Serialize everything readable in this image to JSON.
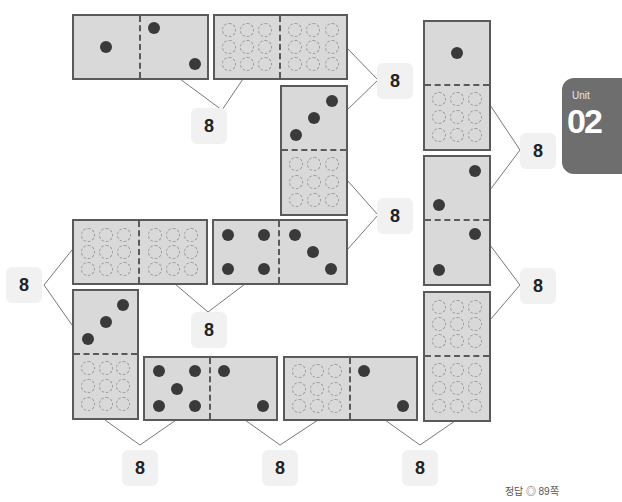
{
  "badge": {
    "unit_label": "Unit",
    "unit_number": "02",
    "color": "#6e6e6e"
  },
  "answer_ref": "정답 ◎ 89쪽",
  "labels": [
    {
      "id": "top-mid",
      "value": "8"
    },
    {
      "id": "top-right",
      "value": "8"
    },
    {
      "id": "mid-right-a",
      "value": "8"
    },
    {
      "id": "far-right-a",
      "value": "8"
    },
    {
      "id": "far-right-b",
      "value": "8"
    },
    {
      "id": "left",
      "value": "8"
    },
    {
      "id": "mid",
      "value": "8"
    },
    {
      "id": "bottom-1",
      "value": "8"
    },
    {
      "id": "bottom-2",
      "value": "8"
    },
    {
      "id": "bottom-3",
      "value": "8"
    }
  ],
  "dominoes": [
    {
      "id": "d1",
      "orientation": "horizontal",
      "a": "1",
      "b": "2"
    },
    {
      "id": "d2",
      "orientation": "horizontal",
      "a": "?",
      "b": "?"
    },
    {
      "id": "d3",
      "orientation": "vertical",
      "a": "3",
      "b": "?"
    },
    {
      "id": "d4",
      "orientation": "vertical",
      "a": "1",
      "b": "?"
    },
    {
      "id": "d5",
      "orientation": "vertical",
      "a": "2",
      "b": "2"
    },
    {
      "id": "d6",
      "orientation": "vertical",
      "a": "?",
      "b": "?"
    },
    {
      "id": "d7",
      "orientation": "horizontal",
      "a": "?",
      "b": "?"
    },
    {
      "id": "d8",
      "orientation": "horizontal",
      "a": "4",
      "b": "3"
    },
    {
      "id": "d9",
      "orientation": "vertical",
      "a": "3",
      "b": "?"
    },
    {
      "id": "d10",
      "orientation": "horizontal",
      "a": "5",
      "b": "2"
    },
    {
      "id": "d11",
      "orientation": "horizontal",
      "a": "?",
      "b": "2"
    }
  ]
}
